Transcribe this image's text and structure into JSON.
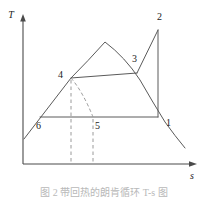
{
  "figure": {
    "name": "temperature-entropy-diagram",
    "background_color": "#ffffff",
    "line_color": "#3f3f3f",
    "dashed_color": "#8a8a8a",
    "text_color": "#1a1a1a"
  },
  "axes": {
    "y_label": "T",
    "x_label": "s",
    "origin": {
      "x": 23,
      "y": 164
    },
    "y_top": {
      "x": 23,
      "y": 18
    },
    "x_right": {
      "x": 196,
      "y": 164
    }
  },
  "state_points": [
    {
      "id": "1",
      "label": "1",
      "x": 158,
      "y": 117,
      "label_x": 165,
      "label_y": 126
    },
    {
      "id": "2",
      "label": "2",
      "x": 158,
      "y": 30,
      "label_x": 156,
      "label_y": 20
    },
    {
      "id": "3",
      "label": "3",
      "x": 137,
      "y": 73,
      "label_x": 132,
      "label_y": 61
    },
    {
      "id": "4",
      "label": "4",
      "x": 71,
      "y": 78,
      "label_x": 59,
      "label_y": 76
    },
    {
      "id": "5",
      "label": "5",
      "x": 93,
      "y": 117,
      "label_x": 95,
      "label_y": 129
    },
    {
      "id": "6",
      "label": "6",
      "x": 40,
      "y": 117,
      "label_x": 36,
      "label_y": 129
    }
  ],
  "curves": {
    "saturation_dome": "M 24,139 L 71,78 Q 88,61 105,42 Q 125,57 140,80 Q 152,101 165,122 Q 175,136 185,148",
    "process_2_to_3": "M 158,30 L 137,73",
    "process_2_to_1": "M 158,30 L 158,117",
    "process_4_to_3": "M 71,78 L 137,73",
    "process_6_to_1": "M 40,117 L 158,117",
    "expansion_dashed_4_to_5": "M 71,78 Q 82,92 93,117",
    "dashed_vertical_4": "M 71,78 L 71,163",
    "dashed_vertical_5": "M 93,117 L 93,163"
  },
  "caption": {
    "text": "图 2 带回热的朗肯循环 T-s 图"
  }
}
